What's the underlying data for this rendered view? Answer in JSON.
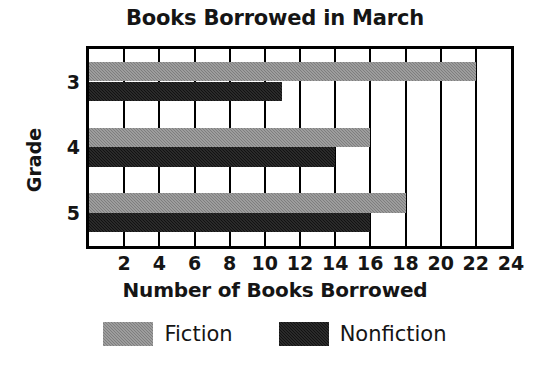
{
  "chart_data": {
    "type": "bar",
    "orientation": "horizontal",
    "title": "Books Borrowed in March",
    "xlabel": "Number of Books Borrowed",
    "ylabel": "Grade",
    "categories": [
      "3",
      "4",
      "5"
    ],
    "series": [
      {
        "name": "Fiction",
        "color": "#8a8a8a",
        "values": [
          22,
          16,
          18
        ]
      },
      {
        "name": "Nonfiction",
        "color": "#121212",
        "values": [
          11,
          14,
          16
        ]
      }
    ],
    "xlim": [
      0,
      24
    ],
    "xticks": [
      2,
      4,
      6,
      8,
      10,
      12,
      14,
      16,
      18,
      20,
      22,
      24
    ],
    "xtick_labels": [
      "2",
      "4",
      "6",
      "8",
      "10",
      "12",
      "14",
      "16",
      "18",
      "20",
      "22",
      "24"
    ],
    "grid": "vertical",
    "legend_position": "bottom",
    "legend": [
      "Fiction",
      "Nonfiction"
    ]
  }
}
